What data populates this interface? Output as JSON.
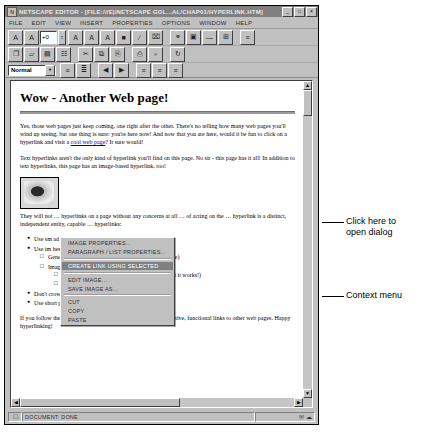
{
  "window": {
    "title": "Netscape Editor - [file:///E|/Netscape Gol...al/Chap01/hyperlink.htm]",
    "icon": "netscape-icon",
    "buttons": {
      "minimize": "_",
      "maximize": "□",
      "close": "×"
    }
  },
  "menubar": {
    "items": [
      {
        "label": "File"
      },
      {
        "label": "Edit"
      },
      {
        "label": "View"
      },
      {
        "label": "Insert"
      },
      {
        "label": "Properties"
      },
      {
        "label": "Options"
      },
      {
        "label": "Window"
      },
      {
        "label": "Help"
      }
    ]
  },
  "format_toolbar": {
    "buttons": [
      {
        "name": "decrease-font-size-button",
        "glyph": "A"
      },
      {
        "name": "increase-font-size-button",
        "glyph": "A"
      }
    ],
    "font_size_value": "+0",
    "spinner_glyph": "↕",
    "style_buttons": [
      {
        "name": "bold-button",
        "glyph": "A"
      },
      {
        "name": "italic-button",
        "glyph": "A"
      },
      {
        "name": "fixed-width-button",
        "glyph": "A"
      },
      {
        "name": "font-color-button",
        "glyph": "■"
      },
      {
        "name": "clear-style-button",
        "glyph": "∕"
      },
      {
        "name": "remove-links-button",
        "glyph": "⌧"
      }
    ],
    "insert_buttons": [
      {
        "name": "make-link-button",
        "glyph": "⚭"
      },
      {
        "name": "insert-image-button",
        "glyph": "▣"
      },
      {
        "name": "insert-horizontal-line-button",
        "glyph": "—"
      },
      {
        "name": "insert-table-button",
        "glyph": "⊞"
      },
      {
        "name": "insert-target-button",
        "glyph": "≡"
      }
    ]
  },
  "file_toolbar": {
    "buttons": [
      {
        "name": "new-document-button",
        "glyph": "❐"
      },
      {
        "name": "open-file-button",
        "glyph": "▱"
      },
      {
        "name": "save-file-button",
        "glyph": "▤"
      },
      {
        "name": "browse-document-button",
        "glyph": "☷"
      },
      {
        "name": "cut-button",
        "glyph": "✂"
      },
      {
        "name": "copy-button",
        "glyph": "⧉"
      },
      {
        "name": "paste-button",
        "glyph": "⎘"
      },
      {
        "name": "print-button",
        "glyph": "⎙"
      },
      {
        "name": "find-button",
        "glyph": "⌕"
      },
      {
        "name": "publish-button",
        "glyph": "↻"
      }
    ]
  },
  "paragraph_toolbar": {
    "style_value": "Normal",
    "dropdown_arrow": "▼",
    "buttons": [
      {
        "name": "bullet-list-button",
        "glyph": "≡"
      },
      {
        "name": "numbered-list-button",
        "glyph": "≣"
      },
      {
        "name": "decrease-indent-button",
        "glyph": "◀"
      },
      {
        "name": "increase-indent-button",
        "glyph": "▶"
      },
      {
        "name": "align-left-button",
        "glyph": "≡"
      },
      {
        "name": "align-center-button",
        "glyph": "≡"
      },
      {
        "name": "align-right-button",
        "glyph": "≡"
      }
    ]
  },
  "document": {
    "heading": "Wow - Another Web page!",
    "paragraph1_pre": "Yes, those web pages just keep coming, one right after the other.  There's no telling how many web pages you'll wind up seeing, but one thing is sure: you're here now! And now that you are here, would it be fun to click on a hyperlink and visit a ",
    "paragraph1_link": "cool web page",
    "paragraph1_post": "?  It sure would!",
    "paragraph2": "Text hyperlinks aren't the only kind of hyperlink you'll find on this page.  No sir - this page has it all! In addition to text hyperlinks, this page has an image-based hyperlink, too!",
    "paragraph3": "They will not  … hyperlinks on a page without any concerns at all  … of acting on the … hyperlink is a distinct, independent entity, capable … hyperlinks:",
    "paragraph3_visible_a": "hyperlinks on a page without any concerns at all.",
    "paragraph3_visible_b": "hyperlink is a distinct, independent entity, cap­able",
    "paragraph3_visible_c": "perlinks:",
    "paragraph3_left_a": "They will no",
    "paragraph3_left_b": "of acting on t",
    "image_alt": "eye-image",
    "bullets": [
      {
        "text_left": "Use sm",
        "text_right": "ad and display quickly"
      },
      {
        "text_left": "Use im",
        "text_right": "hese include:"
      }
    ],
    "sub_bullets": [
      "Generic images that suggest a link (like the eye above)",
      "Images that suggest a specific link:"
    ],
    "sub_sub_bullets": [
      "A hammer for a link to software tools (trite, but it works!)",
      "A tree for a link to a forestry web page"
    ],
    "bullets_tail": [
      "Don't crowd links too closely",
      "Use short portions of text for links"
    ],
    "paragraph4": "If you follow these simple rules, your web pages will have attractive, functional links to other web pages.  Happy hyperlinking!"
  },
  "context_menu": {
    "items": [
      {
        "label": "Image Properties...",
        "selected": false
      },
      {
        "label": "Paragraph / List Properties...",
        "selected": false
      },
      {
        "separator_after": true
      },
      {
        "label": "Create Link Using Selected",
        "selected": true
      },
      {
        "separator_after": true
      },
      {
        "label": "Edit Image...",
        "selected": false
      },
      {
        "label": "Save Image as...",
        "selected": false
      },
      {
        "separator_after": true
      },
      {
        "label": "Cut",
        "selected": false
      },
      {
        "label": "Copy",
        "selected": false
      },
      {
        "label": "Paste",
        "selected": false
      }
    ]
  },
  "statusbar": {
    "icon": "document-icon",
    "message": "Document: Done",
    "right_icons": "✉ ☁"
  },
  "annotations": [
    {
      "name": "annotation-click-here",
      "text": "Click here to\nopen dialog"
    },
    {
      "name": "annotation-context-menu",
      "text": "Context menu"
    }
  ],
  "colors": {
    "window_face": "#c0c0c0",
    "titlebar": "#808080",
    "menu_highlight": "#808080",
    "link": "#0000b0",
    "page": "#ffffff"
  }
}
